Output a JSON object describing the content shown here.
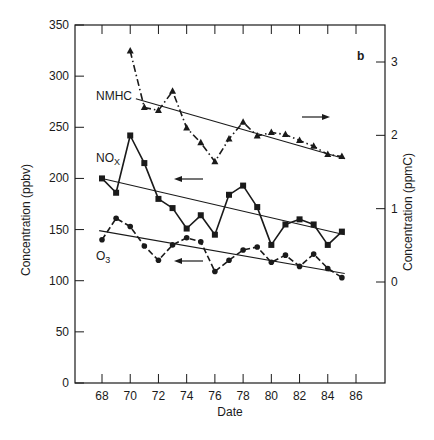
{
  "chart_data": {
    "type": "line",
    "title": "",
    "panel_label": "b",
    "xlabel": "Date",
    "ylabel_left": "Concentration (ppbv)",
    "ylabel_right": "Concentration (ppmC)",
    "x": [
      68,
      69,
      70,
      71,
      72,
      73,
      74,
      75,
      76,
      77,
      78,
      79,
      80,
      81,
      82,
      83,
      84,
      85
    ],
    "x_ticks": [
      68,
      70,
      72,
      74,
      76,
      78,
      80,
      82,
      84,
      86
    ],
    "xlim": [
      66,
      88
    ],
    "y_left_ticks": [
      0,
      50,
      100,
      150,
      200,
      250,
      300,
      350
    ],
    "ylim_left": [
      0,
      350
    ],
    "y_right_ticks": [
      0,
      1,
      2,
      3
    ],
    "ylim_right": [
      -1.35,
      3.45
    ],
    "grid": false,
    "legend": "inline labels",
    "series": [
      {
        "name": "NMHC",
        "axis": "right",
        "marker": "triangle",
        "line_style": "dash-dot",
        "x": [
          70,
          71,
          72,
          73,
          74,
          75,
          76,
          77,
          78,
          79,
          80,
          81,
          82,
          83,
          84,
          85
        ],
        "values": [
          3.15,
          2.38,
          2.34,
          2.6,
          2.1,
          1.9,
          1.64,
          1.95,
          2.18,
          1.99,
          2.04,
          2.01,
          1.93,
          1.85,
          1.74,
          1.71
        ],
        "trend": {
          "x0": 70.4,
          "y0": 2.5,
          "x1": 85.2,
          "y1": 1.68
        },
        "arrow": "right"
      },
      {
        "name": "NOx",
        "axis": "left",
        "marker": "square",
        "line_style": "solid",
        "x": [
          68,
          69,
          70,
          71,
          72,
          73,
          74,
          75,
          76,
          77,
          78,
          79,
          80,
          81,
          82,
          83,
          84,
          85
        ],
        "values": [
          200,
          186,
          242,
          215,
          180,
          171,
          151,
          164,
          145,
          184,
          193,
          172,
          135,
          155,
          160,
          155,
          135,
          148
        ],
        "trend": {
          "x0": 68,
          "y0": 200,
          "x1": 85.2,
          "y1": 145
        },
        "arrow": "left"
      },
      {
        "name": "O3",
        "axis": "left",
        "marker": "circle",
        "line_style": "dashed",
        "x": [
          68,
          69,
          70,
          71,
          72,
          73,
          74,
          75,
          76,
          77,
          78,
          79,
          80,
          81,
          82,
          83,
          84,
          85
        ],
        "values": [
          140,
          161,
          153,
          134,
          120,
          135,
          142,
          138,
          109,
          120,
          130,
          133,
          118,
          125,
          114,
          126,
          112,
          103
        ],
        "trend": {
          "x0": 67.8,
          "y0": 149,
          "x1": 85.2,
          "y1": 107
        },
        "arrow": "left"
      }
    ],
    "annotations": [
      {
        "text": "NMHC",
        "near": "NMHC trend start"
      },
      {
        "text": "NOX",
        "near": "NOx series start"
      },
      {
        "text": "O3",
        "near": "O3 series start"
      },
      {
        "text": "b",
        "position": "top-right"
      }
    ]
  },
  "labels": {
    "panel": "b",
    "xlabel": "Date",
    "ylabel_left": "Concentration (ppbv)",
    "ylabel_right": "Concentration (ppmC)",
    "nmhc": "NMHC",
    "nox_main": "NO",
    "nox_sub": "X",
    "o3_main": "O",
    "o3_sub": "3"
  }
}
